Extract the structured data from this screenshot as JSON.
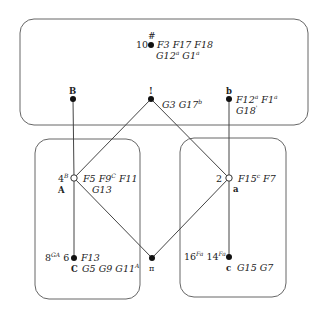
{
  "diagram": {
    "regions": [
      {
        "id": "top",
        "x": 20,
        "y": 19,
        "w": 288,
        "h": 106
      },
      {
        "id": "left",
        "x": 35,
        "y": 139,
        "w": 105,
        "h": 160
      },
      {
        "id": "right",
        "x": 180,
        "y": 138,
        "w": 106,
        "h": 159
      }
    ],
    "nodes": {
      "n10": {
        "label": "10",
        "mark": "#",
        "fill": "filled",
        "annot_line1": "F3 F17 F18",
        "annot_line2_parts": [
          [
            "G12",
            "a"
          ],
          [
            "G1",
            "a"
          ]
        ]
      },
      "B": {
        "label": "B",
        "fill": "filled"
      },
      "bang": {
        "label": "!",
        "fill": "filled",
        "annot_parts": [
          [
            "G3",
            ""
          ],
          [
            "G17",
            "b"
          ]
        ]
      },
      "b": {
        "label": "b",
        "fill": "filled",
        "annot_line1_parts": [
          [
            "F12",
            "a"
          ],
          [
            "F1",
            "a"
          ]
        ],
        "annot_line2_parts": [
          [
            "G18",
            "'"
          ]
        ]
      },
      "A": {
        "label": "A",
        "left_label": "4",
        "left_sup": "B",
        "fill": "open",
        "annot_line1_parts": [
          [
            "F5",
            ""
          ],
          [
            "F9",
            "C"
          ],
          [
            "F11",
            ""
          ]
        ],
        "annot_line2": "G13"
      },
      "a": {
        "label": "a",
        "left_label": "2",
        "fill": "open",
        "annot_line1_parts": [
          [
            "F15",
            "c"
          ],
          [
            "F7",
            ""
          ]
        ]
      },
      "C": {
        "label": "C",
        "left_label_parts": [
          [
            "8",
            "GA"
          ],
          [
            "6",
            ""
          ]
        ],
        "fill": "filled",
        "annot_line1": "F13",
        "annot_line2_parts": [
          [
            "G5",
            ""
          ],
          [
            "G9",
            ""
          ],
          [
            "G11",
            "A"
          ]
        ]
      },
      "pi": {
        "label": "π",
        "fill": "filled"
      },
      "c": {
        "label": "c",
        "left_label_parts": [
          [
            "16",
            "Fa"
          ],
          [
            "14",
            "Fa"
          ]
        ],
        "fill": "filled",
        "annot_line1": "G15 G7"
      }
    },
    "edges": [
      [
        "B",
        "A"
      ],
      [
        "A",
        "C"
      ],
      [
        "b",
        "a"
      ],
      [
        "a",
        "c"
      ],
      [
        "bang",
        "A"
      ],
      [
        "bang",
        "a"
      ],
      [
        "A",
        "pi"
      ],
      [
        "a",
        "pi"
      ]
    ]
  },
  "text": {
    "n10_num": "10",
    "n10_mark": "#",
    "n10_l1": "F3 F17 F18",
    "n10_l2a": "G12",
    "n10_l2a_sup": "a",
    "n10_l2b": "G1",
    "n10_l2b_sup": "a",
    "B": "B",
    "bang": "!",
    "bang_a": "G3",
    "bang_b": "G17",
    "bang_b_sup": "b",
    "b": "b",
    "b_l1a": "F12",
    "b_l1a_sup": "a",
    "b_l1b": "F1",
    "b_l1b_sup": "a",
    "b_l2": "G18",
    "b_l2_sup": "'",
    "A_num": "4",
    "A_num_sup": "B",
    "A": "A",
    "A_l1a": "F5",
    "A_l1b": "F9",
    "A_l1b_sup": "C",
    "A_l1c": "F11",
    "A_l2": "G13",
    "a_num": "2",
    "a": "a",
    "a_l1a": "F15",
    "a_l1a_sup": "c",
    "a_l1b": "F7",
    "C_n1": "8",
    "C_n1_sup": "GA",
    "C_n2": "6",
    "C": "C",
    "C_l1": "F13",
    "C_l2a": "G5",
    "C_l2b": "G9",
    "C_l2c": "G11",
    "C_l2c_sup": "A",
    "pi": "π",
    "c_n1": "16",
    "c_n1_sup": "Fa",
    "c_n2": "14",
    "c_n2_sup": "Fa",
    "c": "c",
    "c_l1": "G15 G7"
  },
  "colors": {
    "stroke": "#555555",
    "node": "#111111",
    "text": "#222222"
  }
}
